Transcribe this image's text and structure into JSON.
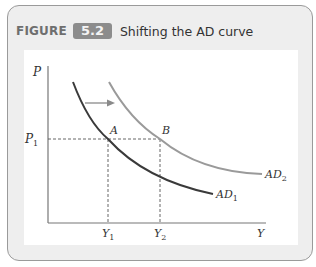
{
  "figure": {
    "label": "FIGURE",
    "number": "5.2",
    "title": "Shifting the AD curve"
  },
  "colors": {
    "ad1": "#3a3a3a",
    "ad2": "#9a9a9a",
    "badge": "#8c8c8c",
    "axis": "#777777"
  },
  "axes": {
    "y_label": "P",
    "x_label": "Y",
    "p1_label": "P",
    "p1_sub": "1",
    "y1_label": "Y",
    "y1_sub": "1",
    "y2_label": "Y",
    "y2_sub": "2"
  },
  "curves": {
    "ad1_label": "AD",
    "ad1_sub": "1",
    "ad2_label": "AD",
    "ad2_sub": "2"
  },
  "points": {
    "a_label": "A",
    "b_label": "B"
  }
}
